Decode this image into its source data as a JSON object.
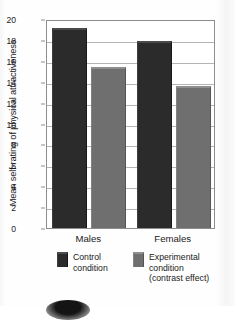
{
  "chart_data": {
    "type": "bar",
    "title": "",
    "xlabel": "",
    "ylabel": "Mean self-rating of physical attractiveness",
    "categories": [
      "Males",
      "Females"
    ],
    "series": [
      {
        "name": "Control condition",
        "values": [
          19.1,
          17.9
        ],
        "color": "#2b2b2b"
      },
      {
        "name": "Experimental condition (contrast effect)",
        "values": [
          15.4,
          13.6
        ],
        "color": "#6f6f6f"
      }
    ],
    "ylim": [
      0,
      20
    ],
    "yticks": [
      0,
      2,
      4,
      6,
      8,
      10,
      12,
      14,
      16,
      18,
      20
    ],
    "ytick_labels": [
      "0",
      "2",
      "4",
      "6",
      "8",
      "10",
      "12",
      "14",
      "16",
      "18",
      "20"
    ],
    "grid": true,
    "legend_position": "bottom"
  },
  "legend": {
    "items": [
      {
        "swatch": "dark-swatch",
        "lines": [
          "Control",
          "condition"
        ]
      },
      {
        "swatch": "light-swatch",
        "lines": [
          "Experimental",
          "condition",
          "(contrast effect)"
        ]
      }
    ]
  }
}
